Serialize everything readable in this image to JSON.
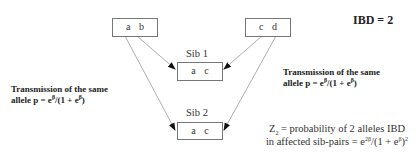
{
  "title": "IBD = 2",
  "parents": [
    {
      "id": "parent-1",
      "alleles": "a b"
    },
    {
      "id": "parent-2",
      "alleles": "c d"
    }
  ],
  "sibs": [
    {
      "label": "Sib 1",
      "alleles": "a c"
    },
    {
      "label": "Sib 2",
      "alleles": "a c"
    }
  ],
  "left_annotation": {
    "line1": "Transmission of the same",
    "line2_prefix": "allele p = e",
    "sup1": "β",
    "line2_mid": "/(1 + e",
    "sup2": "β",
    "line2_suffix": ")"
  },
  "right_annotation": {
    "line1": "Transmission of the same",
    "line2_prefix": "allele p = e",
    "sup1": "β",
    "line2_mid": "/(1 + e",
    "sup2": "β",
    "line2_suffix": ")"
  },
  "formula": {
    "z": "Z",
    "z_sub": "2",
    "line1_rest": " = probability of 2 alleles IBD",
    "line2_prefix": "in affected sib-pairs = e",
    "sup1": "2β",
    "line2_mid": "/(1 + e",
    "sup2": "β",
    "line2_close": ")",
    "sup3": "2"
  },
  "colors": {
    "line": "#999999",
    "arrow": "#111111",
    "box_border": "#777777"
  }
}
